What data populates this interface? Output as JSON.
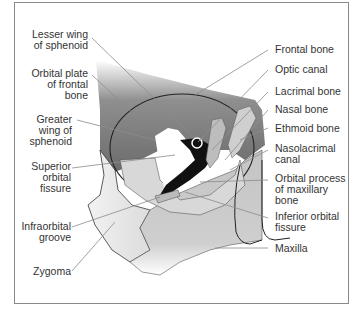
{
  "diagram": {
    "left_labels": [
      {
        "id": "lesser-wing",
        "lines": [
          "Lesser wing",
          "of sphenoid"
        ]
      },
      {
        "id": "orbital-plate",
        "lines": [
          "Orbital plate",
          "of frontal",
          "bone"
        ]
      },
      {
        "id": "greater-wing",
        "lines": [
          "Greater",
          "wing of",
          "sphenoid"
        ]
      },
      {
        "id": "superior-orbital-fissure",
        "lines": [
          "Superior",
          "orbital",
          "fissure"
        ]
      },
      {
        "id": "infraorbital-groove",
        "lines": [
          "Infraorbital",
          "groove"
        ]
      },
      {
        "id": "zygoma",
        "lines": [
          "Zygoma"
        ]
      }
    ],
    "right_labels": [
      {
        "id": "frontal-bone",
        "lines": [
          "Frontal bone"
        ]
      },
      {
        "id": "optic-canal",
        "lines": [
          "Optic canal"
        ]
      },
      {
        "id": "lacrimal-bone",
        "lines": [
          "Lacrimal bone"
        ]
      },
      {
        "id": "nasal-bone",
        "lines": [
          "Nasal bone"
        ]
      },
      {
        "id": "ethmoid-bone",
        "lines": [
          "Ethmoid bone"
        ]
      },
      {
        "id": "nasolacrimal-canal",
        "lines": [
          "Nasolacrimal",
          "canal"
        ]
      },
      {
        "id": "orbital-process",
        "lines": [
          "Orbital process",
          "of maxillary",
          "bone"
        ]
      },
      {
        "id": "inferior-orbital-fissure",
        "lines": [
          "Inferior orbital",
          "fissure"
        ]
      },
      {
        "id": "maxilla",
        "lines": [
          "Maxilla"
        ]
      }
    ],
    "colors": {
      "frontal_dark": "#6e6e6e",
      "bone_light": "#d9d9d9",
      "bone_mid": "#bdbdbd",
      "fissure_black": "#111111",
      "leader_line": "#8c8c8c",
      "label_text": "#333333",
      "frame_border": "#8a8a8a"
    }
  }
}
